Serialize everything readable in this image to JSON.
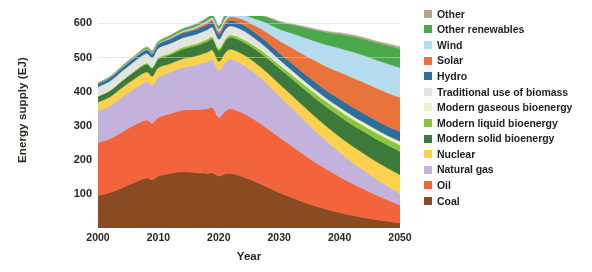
{
  "chart_data": {
    "type": "area",
    "stacked": true,
    "title": "",
    "xlabel": "Year",
    "ylabel": "Energy supply (EJ)",
    "xlim": [
      2000,
      2050
    ],
    "ylim": [
      0,
      620
    ],
    "xticks": [
      "2000",
      "2010",
      "2020",
      "2030",
      "2040",
      "2050"
    ],
    "yticks": [
      "100",
      "200",
      "300",
      "400",
      "500",
      "600"
    ],
    "grid": false,
    "legend_position": "right",
    "x": [
      2000,
      2002,
      2004,
      2006,
      2008,
      2009,
      2010,
      2012,
      2014,
      2016,
      2018,
      2019,
      2020,
      2021,
      2022,
      2024,
      2026,
      2028,
      2030,
      2032,
      2034,
      2036,
      2038,
      2040,
      2042,
      2044,
      2046,
      2048,
      2050
    ],
    "series": [
      {
        "name": "Coal",
        "color": "#8a4a22",
        "values": [
          95,
          104,
          118,
          133,
          146,
          141,
          152,
          160,
          165,
          162,
          160,
          161,
          152,
          158,
          160,
          150,
          136,
          120,
          104,
          90,
          76,
          64,
          54,
          45,
          37,
          31,
          25,
          20,
          15
        ]
      },
      {
        "name": "Oil",
        "color": "#f4643c",
        "values": [
          155,
          157,
          163,
          168,
          170,
          166,
          172,
          175,
          180,
          184,
          189,
          191,
          172,
          183,
          189,
          186,
          180,
          172,
          162,
          151,
          140,
          128,
          116,
          105,
          94,
          83,
          72,
          62,
          52
        ]
      },
      {
        "name": "Natural gas",
        "color": "#c2b2dc",
        "values": [
          92,
          96,
          102,
          107,
          112,
          110,
          117,
          121,
          125,
          130,
          137,
          139,
          136,
          142,
          145,
          142,
          137,
          130,
          121,
          112,
          102,
          92,
          82,
          72,
          63,
          55,
          47,
          40,
          34
        ]
      },
      {
        "name": "Nuclear",
        "color": "#fcd14d",
        "values": [
          26,
          27,
          28,
          28,
          28,
          27,
          28,
          25,
          25,
          26,
          27,
          28,
          27,
          28,
          29,
          30,
          31,
          33,
          35,
          37,
          39,
          41,
          43,
          45,
          47,
          49,
          51,
          53,
          55
        ]
      },
      {
        "name": "Modern solid bioenergy",
        "color": "#3c7a3c",
        "values": [
          17,
          18,
          19,
          21,
          23,
          23,
          25,
          26,
          28,
          30,
          32,
          33,
          32,
          34,
          35,
          37,
          39,
          42,
          45,
          48,
          51,
          54,
          57,
          60,
          62,
          64,
          66,
          67,
          68
        ]
      },
      {
        "name": "Modern liquid bioenergy",
        "color": "#8cc63f",
        "values": [
          1,
          1,
          2,
          3,
          4,
          4,
          5,
          5,
          6,
          6,
          7,
          7,
          6,
          7,
          7,
          8,
          9,
          10,
          11,
          12,
          13,
          14,
          15,
          16,
          17,
          17,
          18,
          18,
          19
        ]
      },
      {
        "name": "Modern gaseous bioenergy",
        "color": "#eef2c8",
        "values": [
          1,
          1,
          1,
          1,
          1,
          1,
          1,
          2,
          2,
          2,
          2,
          2,
          2,
          2,
          2,
          3,
          3,
          4,
          4,
          5,
          6,
          7,
          7,
          8,
          9,
          9,
          10,
          10,
          11
        ]
      },
      {
        "name": "Traditional use of biomass",
        "color": "#e2e4e0",
        "values": [
          26,
          26,
          26,
          26,
          26,
          26,
          26,
          26,
          25,
          25,
          25,
          25,
          25,
          25,
          24,
          22,
          19,
          15,
          11,
          8,
          6,
          4,
          3,
          2,
          1,
          1,
          0,
          0,
          0
        ]
      },
      {
        "name": "Hydro",
        "color": "#2d6e9e",
        "values": [
          9,
          10,
          10,
          11,
          11,
          12,
          12,
          13,
          14,
          14,
          15,
          15,
          15,
          16,
          16,
          17,
          17,
          18,
          19,
          20,
          21,
          22,
          23,
          24,
          25,
          26,
          26,
          27,
          28
        ]
      },
      {
        "name": "Solar",
        "color": "#e8743b",
        "values": [
          0,
          0,
          0,
          0,
          1,
          1,
          1,
          2,
          3,
          4,
          6,
          7,
          8,
          9,
          11,
          15,
          21,
          28,
          36,
          45,
          54,
          63,
          71,
          79,
          86,
          91,
          95,
          98,
          100
        ]
      },
      {
        "name": "Wind",
        "color": "#b6dcf0",
        "values": [
          0,
          0,
          1,
          1,
          2,
          2,
          2,
          3,
          4,
          5,
          6,
          7,
          8,
          9,
          10,
          14,
          20,
          27,
          34,
          42,
          50,
          57,
          64,
          70,
          75,
          79,
          82,
          85,
          87
        ]
      },
      {
        "name": "Other renewables",
        "color": "#4aa74a",
        "values": [
          2,
          2,
          3,
          3,
          4,
          4,
          4,
          5,
          5,
          6,
          7,
          7,
          7,
          8,
          9,
          11,
          14,
          17,
          21,
          25,
          29,
          33,
          37,
          41,
          45,
          48,
          51,
          54,
          56
        ]
      },
      {
        "name": "Other",
        "color": "#b0a888",
        "values": [
          1,
          1,
          1,
          1,
          1,
          1,
          1,
          1,
          1,
          1,
          1,
          1,
          1,
          1,
          1,
          1,
          2,
          2,
          2,
          2,
          3,
          3,
          3,
          4,
          4,
          4,
          4,
          5,
          5
        ]
      }
    ],
    "totals": [
      425,
      443,
      474,
      503,
      529,
      518,
      546,
      564,
      583,
      595,
      614,
      616,
      591,
      612,
      628,
      621,
      608,
      588,
      565,
      547,
      540,
      532,
      530,
      531,
      539,
      543,
      545,
      546,
      545
    ]
  },
  "legend": {
    "items": [
      {
        "label": "Other",
        "color": "#b0a888"
      },
      {
        "label": "Other renewables",
        "color": "#4aa74a"
      },
      {
        "label": "Wind",
        "color": "#b6dcf0"
      },
      {
        "label": "Solar",
        "color": "#e8743b"
      },
      {
        "label": "Hydro",
        "color": "#2d6e9e"
      },
      {
        "label": "Traditional use of biomass",
        "color": "#e2e4e0"
      },
      {
        "label": "Modern gaseous bioenergy",
        "color": "#eef2c8"
      },
      {
        "label": "Modern liquid bioenergy",
        "color": "#8cc63f"
      },
      {
        "label": "Modern solid bioenergy",
        "color": "#3c7a3c"
      },
      {
        "label": "Nuclear",
        "color": "#fcd14d"
      },
      {
        "label": "Natural gas",
        "color": "#c2b2dc"
      },
      {
        "label": "Oil",
        "color": "#f4643c"
      },
      {
        "label": "Coal",
        "color": "#8a4a22"
      }
    ]
  },
  "axes": {
    "y_title": "Energy supply (EJ)",
    "x_title": "Year",
    "y_ticks": [
      "600",
      "500",
      "400",
      "300",
      "200",
      "100"
    ],
    "x_ticks": [
      "2000",
      "2010",
      "2020",
      "2030",
      "2040",
      "2050"
    ]
  }
}
